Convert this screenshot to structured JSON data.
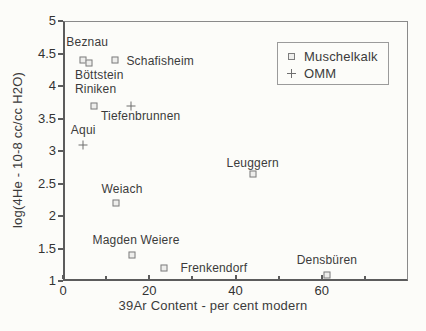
{
  "chart_data": {
    "type": "scatter",
    "title": "",
    "xlabel": "39Ar Content - per cent modern",
    "ylabel": "log(4He - 10-8 cc/cc H2O)",
    "xlim": [
      0,
      80
    ],
    "ylim": [
      1,
      5
    ],
    "grid": false,
    "x_major_ticks": [
      0,
      20,
      40,
      60
    ],
    "x_minor_ticks": [
      10,
      30,
      50,
      70
    ],
    "y_ticks": [
      1,
      1.5,
      2,
      2.5,
      3,
      3.5,
      4,
      4.5,
      5
    ],
    "legend": {
      "position": "top-right",
      "entries": [
        {
          "label": "Muschelkalk",
          "marker": "square"
        },
        {
          "label": "OMM",
          "marker": "plus"
        }
      ]
    },
    "series": [
      {
        "name": "Muschelkalk",
        "marker": "square",
        "points": [
          {
            "label": "Beznau",
            "x": 4.7,
            "y": 4.4,
            "label_dx": 4,
            "label_dy": -18
          },
          {
            "label": "Böttstein",
            "x": 6.1,
            "y": 4.35,
            "label_dx": 10,
            "label_dy": 12
          },
          {
            "label": "Schafisheim",
            "x": 12.1,
            "y": 4.4,
            "label_dx": 45,
            "label_dy": 1
          },
          {
            "label": "Riniken",
            "x": 7.1,
            "y": 3.7,
            "label_dx": 2,
            "label_dy": -17
          },
          {
            "label": "Weiach",
            "x": 12.3,
            "y": 2.2,
            "label_dx": 6,
            "label_dy": -14
          },
          {
            "label": "Magden Weiere",
            "x": 16.0,
            "y": 1.4,
            "label_dx": 4,
            "label_dy": -15
          },
          {
            "label": "Frenkendorf",
            "x": 23.4,
            "y": 1.2,
            "label_dx": 50,
            "label_dy": 0
          },
          {
            "label": "Leuggern",
            "x": 44.0,
            "y": 2.65,
            "label_dx": 0,
            "label_dy": -11
          },
          {
            "label": "Densbüren",
            "x": 61.2,
            "y": 1.1,
            "label_dx": 0,
            "label_dy": -15
          }
        ]
      },
      {
        "name": "OMM",
        "marker": "plus",
        "points": [
          {
            "label": "Aqui",
            "x": 4.7,
            "y": 3.1,
            "label_dx": 0,
            "label_dy": -15
          },
          {
            "label": "Tiefenbrunnen",
            "x": 15.7,
            "y": 3.7,
            "label_dx": 10,
            "label_dy": 10
          }
        ]
      }
    ]
  }
}
